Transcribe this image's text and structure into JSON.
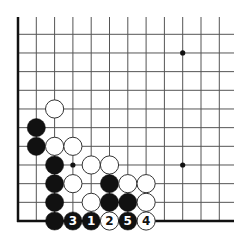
{
  "diagram": {
    "type": "go-board-corner",
    "colors": {
      "background": "#ffffff",
      "grid_line": "#555555",
      "edge_line": "#111111",
      "black_stone": "#111111",
      "white_stone": "#ffffff",
      "white_stone_border": "#333333"
    },
    "grid": {
      "columns": 12,
      "rows": 11,
      "origin_x": 18,
      "origin_y": 221,
      "spacing_x": 18.3,
      "spacing_y": 18.67,
      "line_top": 17,
      "line_right": 234,
      "edges": [
        "left",
        "bottom"
      ]
    },
    "star_points": [
      {
        "col": 3,
        "row": 3
      },
      {
        "col": 9,
        "row": 3
      },
      {
        "col": 9,
        "row": 9
      }
    ],
    "stones": [
      {
        "col": 2,
        "row": 6,
        "color": "white"
      },
      {
        "col": 1,
        "row": 5,
        "color": "black"
      },
      {
        "col": 1,
        "row": 4,
        "color": "black"
      },
      {
        "col": 2,
        "row": 4,
        "color": "white"
      },
      {
        "col": 3,
        "row": 4,
        "color": "white"
      },
      {
        "col": 2,
        "row": 3,
        "color": "black"
      },
      {
        "col": 4,
        "row": 3,
        "color": "white"
      },
      {
        "col": 5,
        "row": 3,
        "color": "white"
      },
      {
        "col": 2,
        "row": 2,
        "color": "black"
      },
      {
        "col": 3,
        "row": 2,
        "color": "white"
      },
      {
        "col": 5,
        "row": 2,
        "color": "black"
      },
      {
        "col": 6,
        "row": 2,
        "color": "white"
      },
      {
        "col": 7,
        "row": 2,
        "color": "white"
      },
      {
        "col": 2,
        "row": 1,
        "color": "black"
      },
      {
        "col": 4,
        "row": 1,
        "color": "white"
      },
      {
        "col": 5,
        "row": 1,
        "color": "black"
      },
      {
        "col": 6,
        "row": 1,
        "color": "black"
      },
      {
        "col": 7,
        "row": 1,
        "color": "white"
      },
      {
        "col": 2,
        "row": 0,
        "color": "black"
      },
      {
        "col": 3,
        "row": 0,
        "color": "black",
        "label": "3"
      },
      {
        "col": 4,
        "row": 0,
        "color": "black",
        "label": "1"
      },
      {
        "col": 5,
        "row": 0,
        "color": "white",
        "label": "2"
      },
      {
        "col": 6,
        "row": 0,
        "color": "black",
        "label": "5"
      },
      {
        "col": 7,
        "row": 0,
        "color": "white",
        "label": "4"
      }
    ],
    "move_sequence": [
      {
        "move": 1,
        "color": "black",
        "col": 4,
        "row": 0
      },
      {
        "move": 2,
        "color": "white",
        "col": 5,
        "row": 0
      },
      {
        "move": 3,
        "color": "black",
        "col": 3,
        "row": 0
      },
      {
        "move": 4,
        "color": "white",
        "col": 7,
        "row": 0
      },
      {
        "move": 5,
        "color": "black",
        "col": 6,
        "row": 0
      }
    ]
  }
}
